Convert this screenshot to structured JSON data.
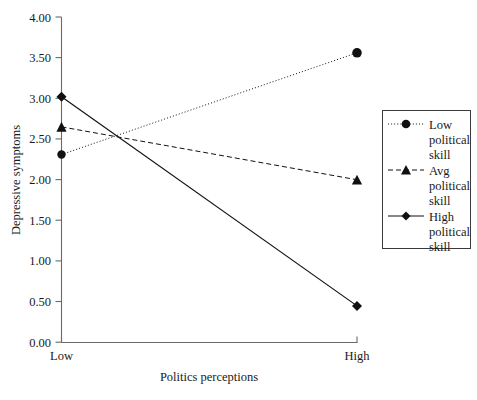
{
  "chart_data": {
    "type": "line",
    "title": "",
    "subtitle": "",
    "xlabel": "Politics perceptions",
    "ylabel": "Depressive symptoms",
    "categories": [
      "Low",
      "High"
    ],
    "ylim": [
      0.0,
      4.0
    ],
    "ytick_step": 0.5,
    "ytick_labels": [
      "0.00",
      "0.50",
      "1.00",
      "1.50",
      "2.00",
      "2.50",
      "3.00",
      "3.50",
      "4.00"
    ],
    "ytick_values": [
      0.0,
      0.5,
      1.0,
      1.5,
      2.0,
      2.5,
      3.0,
      3.5,
      4.0
    ],
    "grid": false,
    "legend_position": "right",
    "series": [
      {
        "name": "Low political skill",
        "name_lines": [
          "Low",
          "political",
          "skill"
        ],
        "values": [
          2.31,
          3.56
        ],
        "line_style": "dotted",
        "marker": "circle",
        "color": "#111111"
      },
      {
        "name": "Avg political skill",
        "name_lines": [
          "Avg",
          "political",
          "skill"
        ],
        "values": [
          2.65,
          2.0
        ],
        "line_style": "dashed",
        "marker": "triangle",
        "color": "#111111"
      },
      {
        "name": "High political skill",
        "name_lines": [
          "High",
          "political",
          "skill"
        ],
        "values": [
          3.02,
          0.45
        ],
        "line_style": "solid",
        "marker": "diamond",
        "color": "#111111"
      }
    ],
    "annotations": []
  },
  "axes": {
    "y_labels": {
      "t0": "0.00",
      "t1": "0.50",
      "t2": "1.00",
      "t3": "1.50",
      "t4": "2.00",
      "t5": "2.50",
      "t6": "3.00",
      "t7": "3.50",
      "t8": "4.00"
    },
    "x_labels": {
      "c0": "Low",
      "c1": "High"
    },
    "y_title": "Depressive symptoms",
    "x_title": "Politics perceptions"
  },
  "legend": {
    "entries": [
      {
        "l0": "Low",
        "l1": "political",
        "l2": "skill"
      },
      {
        "l0": "Avg",
        "l1": "political",
        "l2": "skill"
      },
      {
        "l0": "High",
        "l1": "political",
        "l2": "skill"
      }
    ]
  }
}
